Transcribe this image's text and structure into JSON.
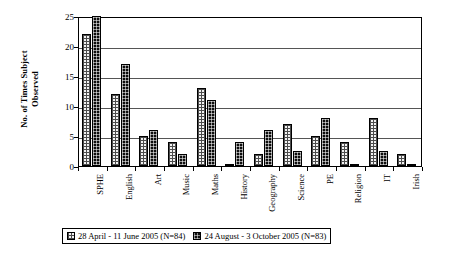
{
  "chart_data": {
    "type": "bar",
    "title": "",
    "xlabel": "",
    "ylabel": "No. of Times Subject Observed",
    "ylabel_lines": [
      "No. of Times Subject",
      "Observed"
    ],
    "ylim": [
      0,
      25
    ],
    "yticks": [
      0,
      5,
      10,
      15,
      20,
      25
    ],
    "ytick_labels": [
      "0",
      "5",
      "10",
      "15",
      "20",
      "25"
    ],
    "grid": true,
    "grid_axis": "y",
    "legend_position": "bottom",
    "categories": [
      "SPHE",
      "English",
      "Art",
      "Music",
      "Maths",
      "History",
      "Geography",
      "Science",
      "PE",
      "Religion",
      "IT",
      "Irish"
    ],
    "series": [
      {
        "name": "28 April - 11 June 2005 (N=84)",
        "pattern": "light-dotted",
        "color": "#f2f2f2",
        "values": [
          22,
          12,
          5,
          4,
          13,
          0,
          2,
          7,
          5,
          4,
          8,
          2
        ]
      },
      {
        "name": "24 August - 3 October 2005 (N=83)",
        "pattern": "solid-black",
        "color": "#111111",
        "values": [
          25,
          17,
          6,
          2,
          11,
          4,
          6,
          2.5,
          8,
          0.3,
          2.5,
          0.3
        ]
      }
    ]
  },
  "legend": {
    "entries": [
      {
        "label": "28 April - 11 June 2005 (N=84)",
        "swatch": "light-dotted-swatch"
      },
      {
        "label": "24 August - 3 October 2005 (N=83)",
        "swatch": "solid-black-swatch"
      }
    ]
  }
}
